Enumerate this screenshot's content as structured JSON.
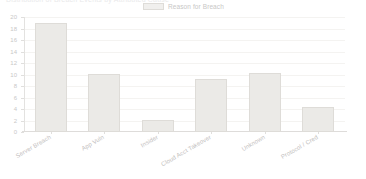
{
  "header": {
    "cutoff_text": "Distribution of Breach Events by Attributed Cause"
  },
  "legend": {
    "position": "top-center",
    "entries": [
      {
        "label": "Reason for Breach",
        "swatch_name": "series-swatch"
      }
    ]
  },
  "colors": {
    "bar_fill": "#ebeae7",
    "bar_border": "#dedcd8",
    "grid": "#f4f3f1",
    "axis": "#dedcda",
    "tick_text": "#c9c8c7",
    "label_text": "#bfbebd",
    "background": "#ffffff"
  },
  "chart_data": {
    "type": "bar",
    "title": "",
    "xlabel": "",
    "ylabel": "",
    "ylim": [
      0,
      20
    ],
    "ytick_step": 2,
    "yticks": [
      0,
      2,
      4,
      6,
      8,
      10,
      12,
      14,
      16,
      18,
      20
    ],
    "grid": true,
    "legend": "Reason for Breach",
    "categories": [
      "Server Breach",
      "App Vuln",
      "Insider",
      "Cloud Acct Takeover",
      "Unknown",
      "Protocol / Cred"
    ],
    "values": [
      19,
      10.1,
      2.1,
      9.2,
      10.3,
      4.3
    ],
    "series": [
      {
        "name": "Reason for Breach",
        "values": [
          19,
          10.1,
          2.1,
          9.2,
          10.3,
          4.3
        ]
      }
    ]
  }
}
